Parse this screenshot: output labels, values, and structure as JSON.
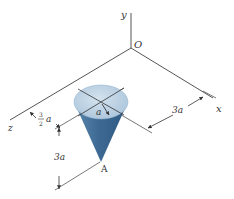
{
  "diagram": {
    "type": "3d-coordinate-figure",
    "axes": {
      "x_label": "x",
      "y_label": "y",
      "z_label": "z",
      "origin_label": "O"
    },
    "cone": {
      "apex_label": "A",
      "radius_label": "a"
    },
    "dimensions": {
      "x_offset": "3a",
      "z_offset_num": "3",
      "z_offset_den": "2",
      "z_offset_var": "a",
      "height": "3a"
    },
    "colors": {
      "cone_side": "#3d6a93",
      "cone_top": "#b9d0e2",
      "lines": "#444444",
      "background": "#ffffff"
    }
  }
}
